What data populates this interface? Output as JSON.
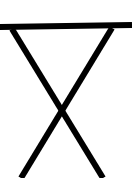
{
  "drawing": {
    "subject": "folding-table-icon",
    "stroke_color": "#000000",
    "background": "#ffffff",
    "top_bar": {
      "x1": 0,
      "y1": 27,
      "x2": 132,
      "y2": 25,
      "width": 6
    },
    "legs": [
      {
        "x1": 12,
        "y1": 29,
        "x2": 103,
        "y2": 178,
        "width": 6
      },
      {
        "x1": 112,
        "y1": 28,
        "x2": 21,
        "y2": 178,
        "width": 6
      }
    ]
  }
}
